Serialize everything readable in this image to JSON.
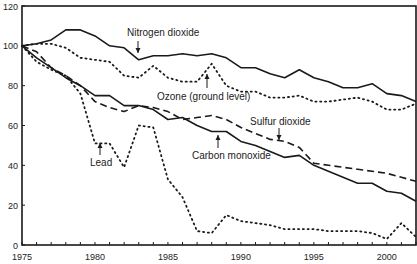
{
  "chart_data": {
    "type": "line",
    "title": "",
    "xlabel": "",
    "ylabel": "",
    "xlim": [
      1975,
      2002
    ],
    "ylim": [
      0,
      120
    ],
    "grid": false,
    "legend_position": "inline annotations",
    "x_ticks": [
      1975,
      1980,
      1985,
      1990,
      1995,
      2000
    ],
    "y_ticks": [
      0,
      20,
      40,
      60,
      80,
      100,
      120
    ],
    "x": [
      1975,
      1976,
      1977,
      1978,
      1979,
      1980,
      1981,
      1982,
      1983,
      1984,
      1985,
      1986,
      1987,
      1988,
      1989,
      1990,
      1991,
      1992,
      1993,
      1994,
      1995,
      1996,
      1997,
      1998,
      1999,
      2000,
      2001,
      2002
    ],
    "series": [
      {
        "name": "Nitrogen dioxide",
        "style": "solid",
        "values": [
          100,
          101,
          103,
          108,
          108,
          105,
          100,
          99,
          93,
          95,
          95,
          96,
          95,
          96,
          94,
          89,
          89,
          86,
          84,
          88,
          84,
          82,
          79,
          79,
          81,
          76,
          75,
          72
        ]
      },
      {
        "name": "Ozone (ground level)",
        "style": "dotted",
        "values": [
          100,
          101,
          101,
          99,
          94,
          93,
          92,
          85,
          84,
          90,
          84,
          82,
          82,
          91,
          80,
          77,
          77,
          74,
          74,
          75,
          72,
          72,
          73,
          74,
          72,
          68,
          68,
          71
        ]
      },
      {
        "name": "Sulfur dioxide",
        "style": "dashed",
        "values": [
          100,
          97,
          89,
          85,
          80,
          72,
          69,
          67,
          70,
          69,
          67,
          63,
          64,
          65,
          63,
          59,
          56,
          53,
          52,
          49,
          41,
          40,
          39,
          38,
          37,
          36,
          34,
          32
        ]
      },
      {
        "name": "Carbon monoxide",
        "style": "solid",
        "values": [
          100,
          94,
          89,
          84,
          80,
          75,
          75,
          70,
          70,
          68,
          63,
          64,
          60,
          57,
          57,
          52,
          50,
          47,
          44,
          45,
          40,
          37,
          34,
          31,
          31,
          27,
          26,
          22
        ]
      },
      {
        "name": "Lead",
        "style": "dotted",
        "values": [
          100,
          92,
          88,
          85,
          76,
          51,
          51,
          39,
          60,
          59,
          33,
          24,
          7,
          6,
          15,
          12,
          11,
          10,
          8,
          8,
          8,
          7,
          7,
          7,
          6,
          3,
          11,
          4
        ]
      }
    ],
    "annotations": [
      {
        "text": "Nitrogen dioxide",
        "arrow": "down",
        "x": 1983.7,
        "y": 94
      },
      {
        "text": "Ozone (ground level)",
        "arrow": "up",
        "x": 1987.6,
        "y": 90
      },
      {
        "text": "Sulfur dioxide",
        "arrow": "down",
        "x": 1991.9,
        "y": 53
      },
      {
        "text": "Carbon monoxide",
        "arrow": "up",
        "x": 1986.5,
        "y": 57
      },
      {
        "text": "Lead",
        "arrow": "up",
        "x": 1980.1,
        "y": 51
      }
    ]
  },
  "labels": {
    "nitrogen": "Nitrogen dioxide",
    "ozone": "Ozone (ground level)",
    "sulfur": "Sulfur dioxide",
    "carbon": "Carbon monoxide",
    "lead": "Lead"
  },
  "colors": {
    "line": "#1a1a1a",
    "axis": "#1a1a1a",
    "background": "#ffffff"
  }
}
